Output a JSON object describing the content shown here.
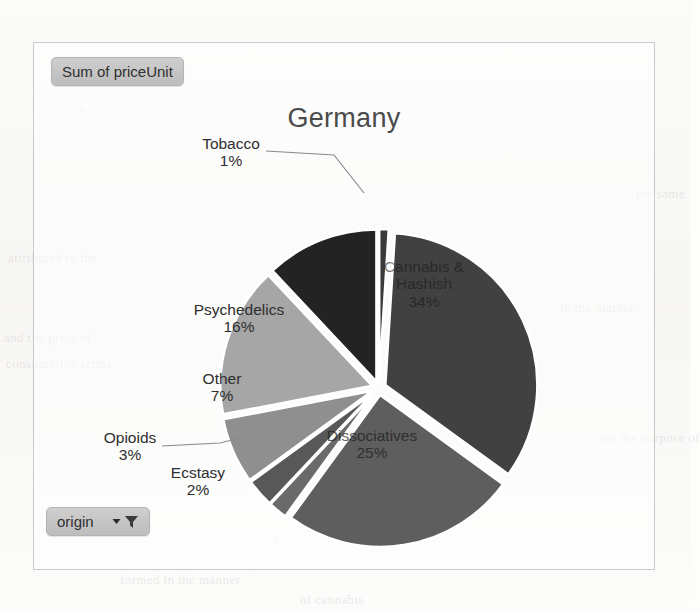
{
  "document": {
    "background_color": "#fdfdfc",
    "bleed_text": [
      "attributed to the",
      "and the price of",
      "consumption terms",
      "in the market",
      "of cannabis",
      "formed in the manner",
      "for the purpose of",
      "the same"
    ]
  },
  "chart_frame": {
    "border_color": "#c9c9c9"
  },
  "legend_field_button": {
    "label": "Sum of priceUnit",
    "name": "sum-of-price-unit-field"
  },
  "origin_filter_button": {
    "label": "origin",
    "dropdown_icon": "chevron-down-icon",
    "filter_icon": "funnel-filter-icon"
  },
  "chart_data": {
    "type": "pie",
    "title": "Germany",
    "value_field": "Sum of priceUnit",
    "category_field": "origin",
    "label_format": "category + percentage",
    "legend": "none",
    "exploded": true,
    "gap_color": "#ffffff",
    "categories": [
      "Tobacco",
      "Cannabis & Hashish",
      "Dissociatives",
      "Ecstasy",
      "Opioids",
      "Other",
      "Psychedelics",
      "Stimulants"
    ],
    "values": [
      1,
      34,
      25,
      2,
      3,
      7,
      16,
      12
    ],
    "slices": [
      {
        "label": "Tobacco",
        "percent": 1,
        "percent_text": "1%",
        "color": "#3a3a3a",
        "label_position": "outside",
        "leader_line": true
      },
      {
        "label": "Cannabis & Hashish",
        "label_line1": "Cannabis &",
        "label_line2": "Hashish",
        "percent": 34,
        "percent_text": "34%",
        "color": "#414141",
        "label_position": "inside"
      },
      {
        "label": "Dissociatives",
        "percent": 25,
        "percent_text": "25%",
        "color": "#5e5e5e",
        "label_position": "inside"
      },
      {
        "label": "Ecstasy",
        "percent": 2,
        "percent_text": "2%",
        "color": "#6a6a6a",
        "label_position": "outside"
      },
      {
        "label": "Opioids",
        "percent": 3,
        "percent_text": "3%",
        "color": "#585858",
        "label_position": "outside",
        "leader_line": true
      },
      {
        "label": "Other",
        "percent": 7,
        "percent_text": "7%",
        "color": "#8f8f8f",
        "label_position": "outside"
      },
      {
        "label": "Psychedelics",
        "percent": 16,
        "percent_text": "16%",
        "color": "#a6a6a6",
        "label_position": "outside"
      },
      {
        "label": "Stimulants",
        "percent": 12,
        "percent_text": "12%",
        "color": "#232323",
        "label_position": "none"
      }
    ]
  }
}
